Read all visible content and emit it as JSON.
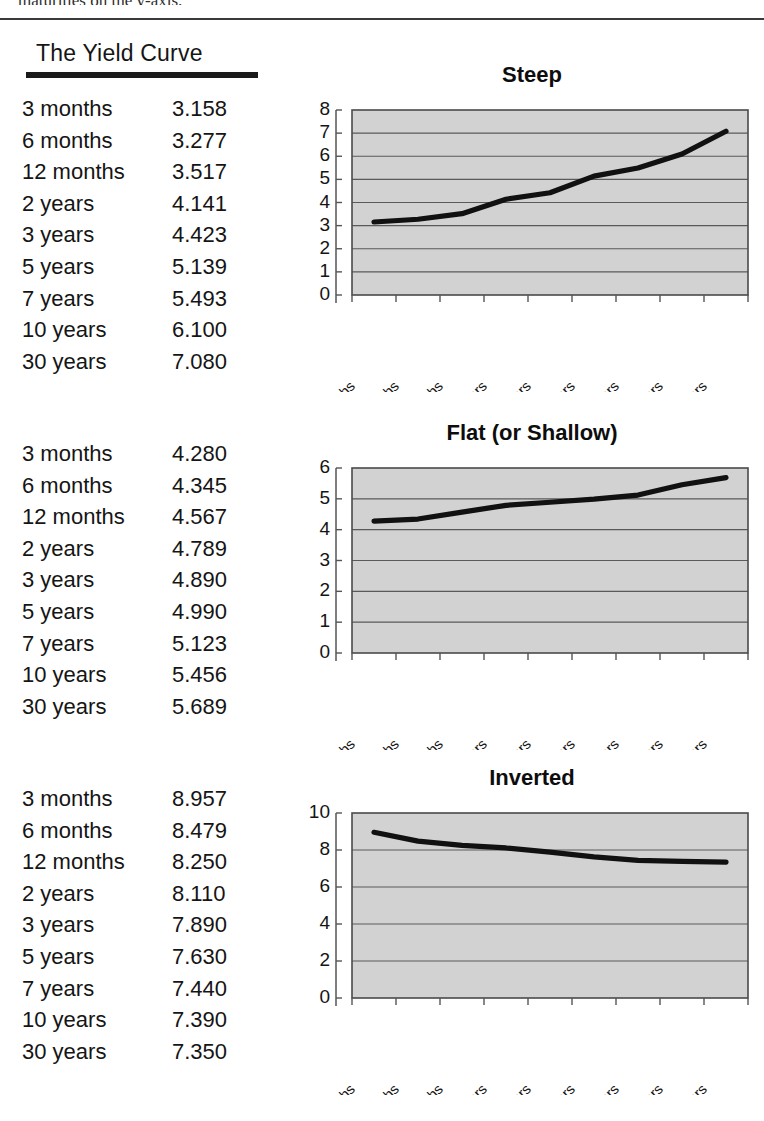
{
  "page": {
    "clipped_header_text": "maturities on the y-axis.",
    "heading": "The Yield Curve"
  },
  "sections": [
    {
      "chart_title": "Steep",
      "table": {
        "rows": [
          {
            "maturity": "3 months",
            "yield": "3.158"
          },
          {
            "maturity": "6 months",
            "yield": "3.277"
          },
          {
            "maturity": "12 months",
            "yield": "3.517"
          },
          {
            "maturity": "2 years",
            "yield": "4.141"
          },
          {
            "maturity": "3 years",
            "yield": "4.423"
          },
          {
            "maturity": "5 years",
            "yield": "5.139"
          },
          {
            "maturity": "7 years",
            "yield": "5.493"
          },
          {
            "maturity": "10 years",
            "yield": "6.100"
          },
          {
            "maturity": "30 years",
            "yield": "7.080"
          }
        ]
      }
    },
    {
      "chart_title": "Flat (or Shallow)",
      "table": {
        "rows": [
          {
            "maturity": "3 months",
            "yield": "4.280"
          },
          {
            "maturity": "6 months",
            "yield": "4.345"
          },
          {
            "maturity": "12 months",
            "yield": "4.567"
          },
          {
            "maturity": "2 years",
            "yield": "4.789"
          },
          {
            "maturity": "3 years",
            "yield": "4.890"
          },
          {
            "maturity": "5 years",
            "yield": "4.990"
          },
          {
            "maturity": "7 years",
            "yield": "5.123"
          },
          {
            "maturity": "10 years",
            "yield": "5.456"
          },
          {
            "maturity": "30 years",
            "yield": "5.689"
          }
        ]
      }
    },
    {
      "chart_title": "Inverted",
      "table": {
        "rows": [
          {
            "maturity": "3 months",
            "yield": "8.957"
          },
          {
            "maturity": "6 months",
            "yield": "8.479"
          },
          {
            "maturity": "12 months",
            "yield": "8.250"
          },
          {
            "maturity": "2 years",
            "yield": "8.110"
          },
          {
            "maturity": "3 years",
            "yield": "7.890"
          },
          {
            "maturity": "5 years",
            "yield": "7.630"
          },
          {
            "maturity": "7 years",
            "yield": "7.440"
          },
          {
            "maturity": "10 years",
            "yield": "7.390"
          },
          {
            "maturity": "30 years",
            "yield": "7.350"
          }
        ]
      }
    }
  ],
  "chart_data": [
    {
      "type": "line",
      "title": "Steep",
      "xlabel": "",
      "ylabel": "",
      "categories": [
        "3 months",
        "6 months",
        "12 months",
        "2 years",
        "3 years",
        "5 years",
        "7 years",
        "10 years",
        "30 years"
      ],
      "values": [
        3.158,
        3.277,
        3.517,
        4.141,
        4.423,
        5.139,
        5.493,
        6.1,
        7.08
      ],
      "ylim": [
        0,
        8
      ],
      "ytick_step": 1,
      "yticks": [
        8,
        7,
        6,
        5,
        4,
        3,
        2,
        1,
        0
      ],
      "grid": true,
      "legend": false,
      "plot_background": "#d2d2d2",
      "line_color": "#111111"
    },
    {
      "type": "line",
      "title": "Flat (or Shallow)",
      "xlabel": "",
      "ylabel": "",
      "categories": [
        "3 months",
        "6 months",
        "12 months",
        "2 years",
        "3 years",
        "5 years",
        "7 years",
        "10 years",
        "30 years"
      ],
      "values": [
        4.28,
        4.345,
        4.567,
        4.789,
        4.89,
        4.99,
        5.123,
        5.456,
        5.689
      ],
      "ylim": [
        0,
        6
      ],
      "ytick_step": 1,
      "yticks": [
        6,
        5,
        4,
        3,
        2,
        1,
        0
      ],
      "grid": true,
      "legend": false,
      "plot_background": "#d2d2d2",
      "line_color": "#111111"
    },
    {
      "type": "line",
      "title": "Inverted",
      "xlabel": "",
      "ylabel": "",
      "categories": [
        "3 months",
        "6 months",
        "12 months",
        "2 years",
        "3 years",
        "5 years",
        "7 years",
        "10 years",
        "30 years"
      ],
      "values": [
        8.957,
        8.479,
        8.25,
        8.11,
        7.89,
        7.63,
        7.44,
        7.39,
        7.35
      ],
      "ylim": [
        0,
        10
      ],
      "ytick_step": 2,
      "yticks": [
        10,
        8,
        6,
        4,
        2,
        0
      ],
      "grid": true,
      "legend": false,
      "plot_background": "#d2d2d2",
      "line_color": "#111111"
    }
  ]
}
